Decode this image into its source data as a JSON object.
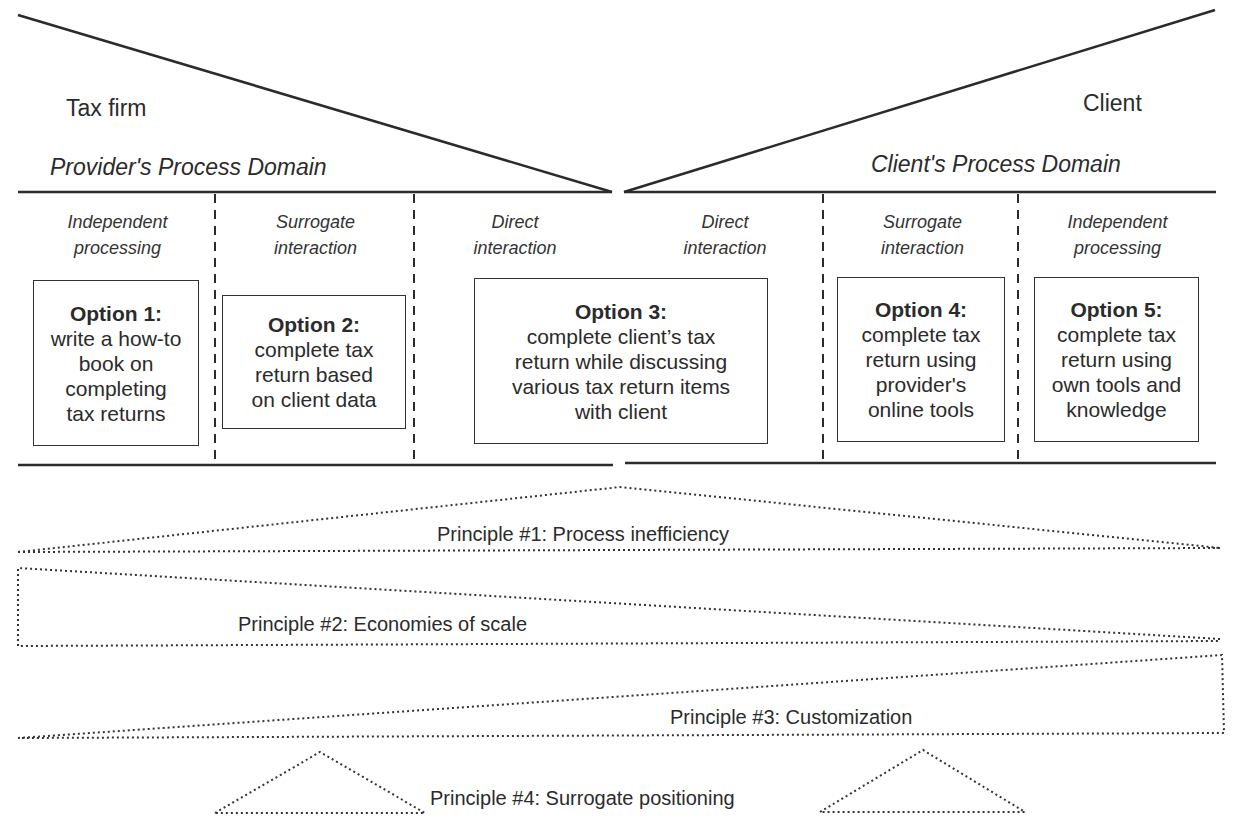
{
  "provider": {
    "actor": "Tax firm",
    "domain_label": "Provider's Process Domain"
  },
  "client": {
    "actor": "Client",
    "domain_label": "Client's Process Domain"
  },
  "interaction_modes": [
    {
      "label": "Independent\nprocessing",
      "side": "provider"
    },
    {
      "label": "Surrogate\ninteraction",
      "side": "provider"
    },
    {
      "label": "Direct\ninteraction",
      "side": "provider"
    },
    {
      "label": "Direct\ninteraction",
      "side": "client"
    },
    {
      "label": "Surrogate\ninteraction",
      "side": "client"
    },
    {
      "label": "Independent\nprocessing",
      "side": "client"
    }
  ],
  "options": [
    {
      "title": "Option 1:",
      "description": "write a how-to\nbook on\ncompleting\ntax returns"
    },
    {
      "title": "Option 2:",
      "description": "complete tax\nreturn based\non client data"
    },
    {
      "title": "Option 3:",
      "description": "complete client’s tax\nreturn while discussing\nvarious tax return items\nwith client"
    },
    {
      "title": "Option 4:",
      "description": "complete tax\nreturn using\nprovider's\nonline tools"
    },
    {
      "title": "Option 5:",
      "description": "complete tax\nreturn using\nown tools and\nknowledge"
    }
  ],
  "principles": [
    {
      "label": "Principle #1: Process inefficiency",
      "shape": "peak-center"
    },
    {
      "label": "Principle #2: Economies of scale",
      "shape": "wedge-left-wide"
    },
    {
      "label": "Principle #3: Customization",
      "shape": "wedge-right-wide"
    },
    {
      "label": "Principle #4: Surrogate positioning",
      "shape": "twin-triangles"
    }
  ]
}
